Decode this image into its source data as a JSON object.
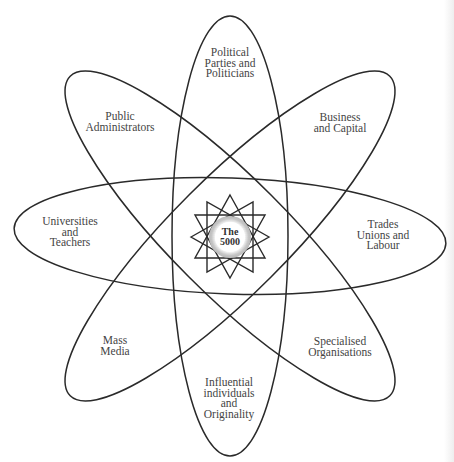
{
  "diagram": {
    "type": "flower-venn",
    "center": {
      "label_lines": [
        "The",
        "5000"
      ]
    },
    "petals": [
      {
        "id": "political",
        "label_lines": [
          "Political",
          "Parties and",
          "Politicians"
        ],
        "x": 230,
        "y": 63
      },
      {
        "id": "business",
        "label_lines": [
          "Business",
          "and Capital"
        ],
        "x": 340,
        "y": 122
      },
      {
        "id": "trades",
        "label_lines": [
          "Trades",
          "Unions and",
          "Labour"
        ],
        "x": 383,
        "y": 235
      },
      {
        "id": "specialised",
        "label_lines": [
          "Specialised",
          "Organisations"
        ],
        "x": 340,
        "y": 346
      },
      {
        "id": "influential",
        "label_lines": [
          "Influential",
          "individuals",
          "and",
          "Originality"
        ],
        "x": 229,
        "y": 398
      },
      {
        "id": "mass-media",
        "label_lines": [
          "Mass",
          "Media"
        ],
        "x": 115,
        "y": 345
      },
      {
        "id": "universities",
        "label_lines": [
          "Universities",
          "and",
          "Teachers"
        ],
        "x": 70,
        "y": 232
      },
      {
        "id": "public-admin",
        "label_lines": [
          "Public",
          "Administrators"
        ],
        "x": 120,
        "y": 121
      }
    ],
    "stroke_color": "#2a2a2a",
    "text_color": "#444444"
  }
}
